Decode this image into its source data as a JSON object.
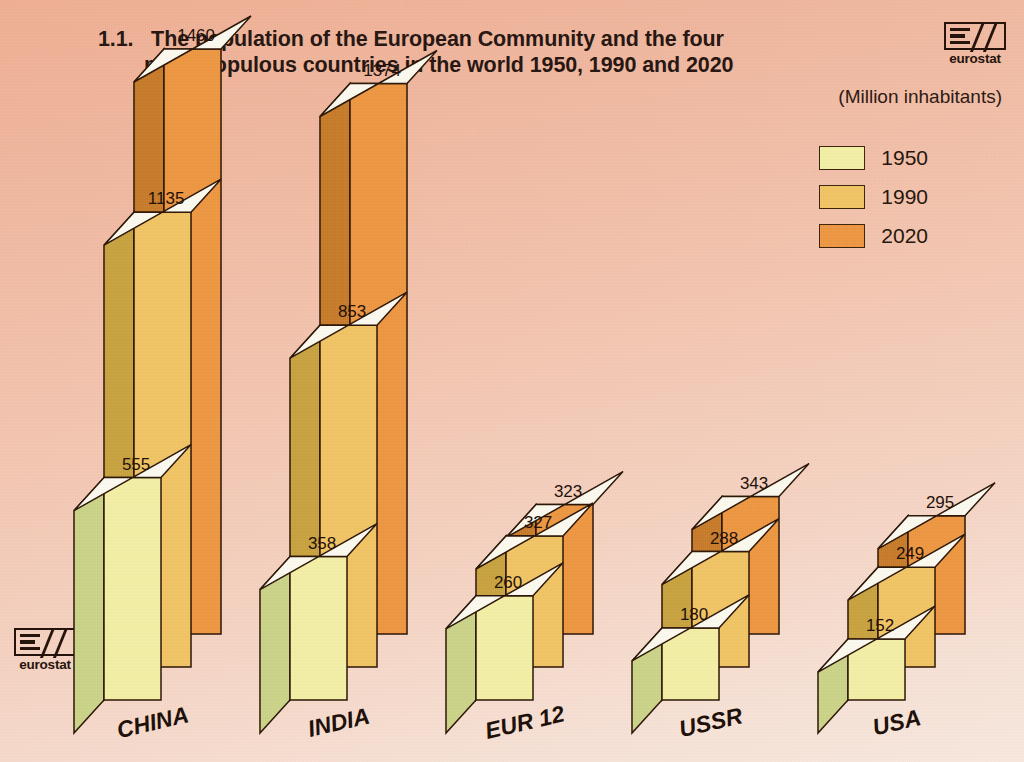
{
  "title": {
    "number": "1.1.",
    "line1": "The population of the European Community and the four",
    "line2": "most populous countries in the world 1950, 1990 and 2020"
  },
  "units_label": "(Million inhabitants)",
  "logo": {
    "word": "eurostat"
  },
  "legend": {
    "items": [
      {
        "label": "1950",
        "color": "#f5f0a6"
      },
      {
        "label": "1990",
        "color": "#f2c565"
      },
      {
        "label": "2020",
        "color": "#ee9742"
      }
    ]
  },
  "chart_data": {
    "type": "bar",
    "xlabel": "",
    "ylabel": "Million inhabitants",
    "ylim": [
      0,
      1460
    ],
    "grid": false,
    "legend_position": "top-right",
    "categories": [
      "CHINA",
      "INDIA",
      "EUR 12",
      "USSR",
      "USA"
    ],
    "series": [
      {
        "name": "1950",
        "color": "#f5f0a6",
        "values": [
          555,
          358,
          260,
          180,
          152
        ]
      },
      {
        "name": "1990",
        "color": "#f2c565",
        "values": [
          1135,
          853,
          327,
          288,
          249
        ]
      },
      {
        "name": "2020",
        "color": "#ee9742",
        "values": [
          1460,
          1374,
          323,
          343,
          295
        ]
      }
    ],
    "value_labels": [
      [
        "555",
        "1135",
        "1460"
      ],
      [
        "358",
        "853",
        "1374"
      ],
      [
        "260",
        "327",
        "323"
      ],
      [
        "180",
        "288",
        "343"
      ],
      [
        "152",
        "249",
        "295"
      ]
    ]
  },
  "palette": {
    "background_top": "#f0b094",
    "background_bottom": "#f9e9df",
    "outline": "#2b1505",
    "face_1950": "#f5f0a6",
    "side_1950": "#ccd489",
    "top_1950": "#fdfbf0",
    "face_1990": "#f2c565",
    "side_1990": "#c9a340",
    "top_1990": "#fdfbf0",
    "face_2020": "#ee9742",
    "side_2020": "#c87c2a",
    "top_2020": "#fdfbf0"
  }
}
